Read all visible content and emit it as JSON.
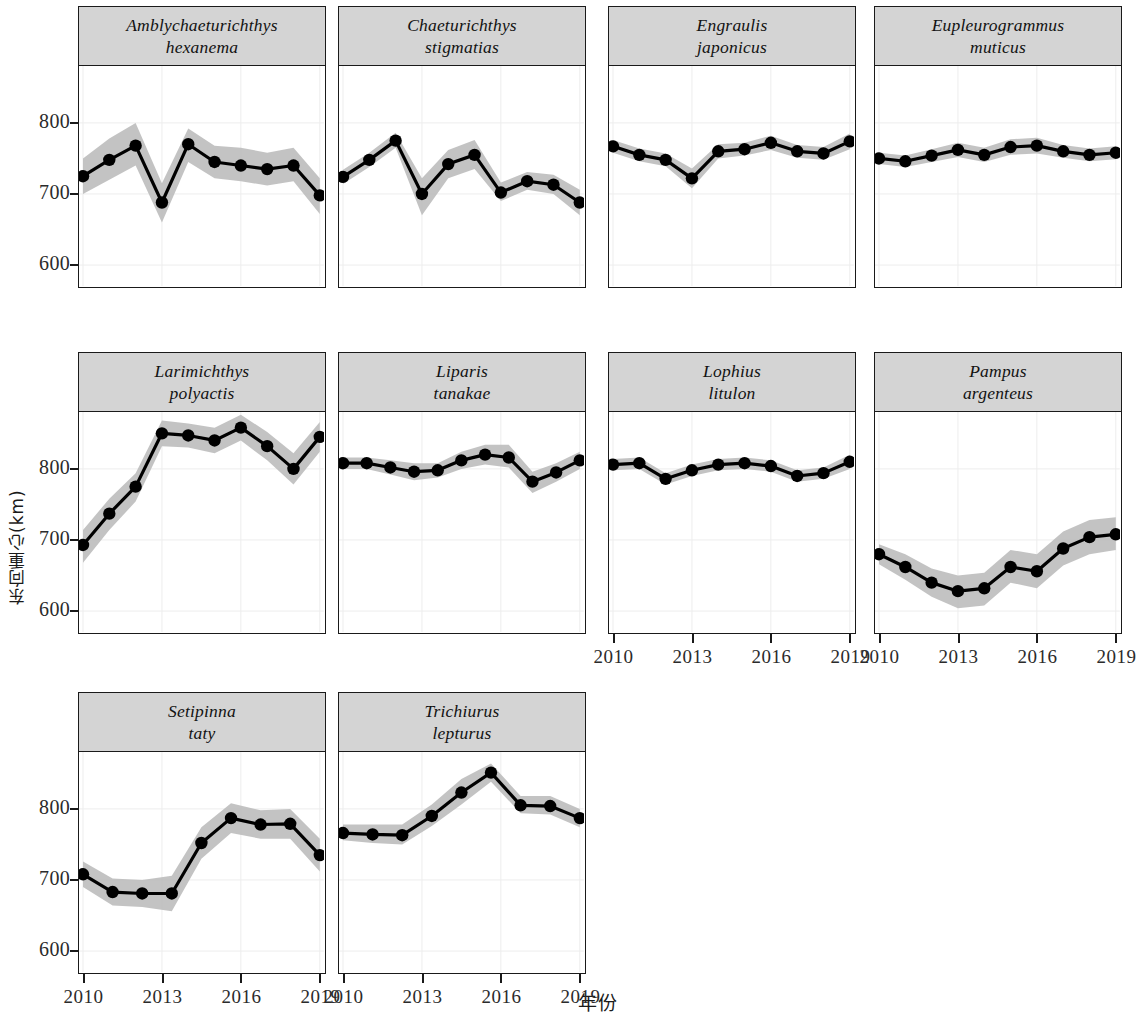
{
  "figure": {
    "y_axis_title": "东向重心(km)",
    "x_axis_title": "年份",
    "y_ticks": [
      "600",
      "700",
      "800"
    ],
    "x_ticks": [
      "2010",
      "2013",
      "2016",
      "2019"
    ]
  },
  "chart_data": {
    "type": "line",
    "title": "",
    "xlabel": "年份",
    "ylabel": "东向重心(km)",
    "xlim": [
      2010,
      2019
    ],
    "ylim": [
      570,
      880
    ],
    "grid": true,
    "legend": "none",
    "x": [
      2010,
      2011,
      2012,
      2013,
      2014,
      2015,
      2016,
      2017,
      2018,
      2019
    ],
    "panels": [
      {
        "name_line1": "Amblychaeturichthys",
        "name_line2": "hexanema",
        "row": 0,
        "col": 0,
        "values": [
          725,
          748,
          768,
          688,
          770,
          745,
          740,
          735,
          740,
          698
        ],
        "lower": [
          700,
          720,
          740,
          660,
          745,
          722,
          718,
          712,
          718,
          672
        ],
        "upper": [
          750,
          778,
          800,
          715,
          792,
          768,
          765,
          758,
          765,
          722
        ]
      },
      {
        "name_line1": "Chaeturichthys",
        "name_line2": "stigmatias",
        "row": 0,
        "col": 1,
        "values": [
          724,
          748,
          775,
          700,
          742,
          755,
          702,
          718,
          713,
          688
        ],
        "lower": [
          714,
          738,
          765,
          670,
          722,
          735,
          690,
          706,
          700,
          670
        ],
        "upper": [
          734,
          758,
          786,
          722,
          762,
          776,
          716,
          731,
          727,
          706
        ]
      },
      {
        "name_line1": "Engraulis",
        "name_line2": "japonicus",
        "row": 0,
        "col": 2,
        "values": [
          767,
          755,
          748,
          722,
          760,
          763,
          772,
          760,
          757,
          774
        ],
        "lower": [
          758,
          746,
          739,
          708,
          750,
          754,
          762,
          751,
          748,
          763
        ],
        "upper": [
          776,
          764,
          757,
          736,
          770,
          772,
          782,
          769,
          766,
          785
        ]
      },
      {
        "name_line1": "Eupleurogrammus",
        "name_line2": "muticus",
        "row": 0,
        "col": 3,
        "values": [
          750,
          746,
          754,
          762,
          755,
          766,
          768,
          760,
          755,
          758
        ],
        "lower": [
          742,
          738,
          745,
          752,
          745,
          755,
          757,
          751,
          746,
          749
        ],
        "upper": [
          758,
          754,
          763,
          772,
          765,
          777,
          779,
          769,
          764,
          767
        ]
      },
      {
        "name_line1": "Larimichthys",
        "name_line2": "polyactis",
        "row": 1,
        "col": 0,
        "values": [
          693,
          737,
          775,
          850,
          847,
          840,
          858,
          832,
          800,
          845
        ],
        "lower": [
          668,
          714,
          754,
          832,
          830,
          822,
          840,
          812,
          778,
          824
        ],
        "upper": [
          714,
          758,
          794,
          868,
          864,
          858,
          876,
          852,
          822,
          866
        ]
      },
      {
        "name_line1": "Liparis",
        "name_line2": "tanakae",
        "row": 1,
        "col": 1,
        "values": [
          808,
          808,
          802,
          796,
          798,
          812,
          820,
          816,
          782,
          795,
          812
        ],
        "lower": [
          800,
          800,
          792,
          784,
          788,
          800,
          806,
          802,
          766,
          782,
          800
        ],
        "upper": [
          816,
          816,
          812,
          808,
          808,
          824,
          834,
          834,
          796,
          808,
          824
        ]
      },
      {
        "name_line1": "Lophius",
        "name_line2": "litulon",
        "row": 1,
        "col": 2,
        "values": [
          806,
          808,
          786,
          798,
          806,
          808,
          804,
          790,
          794,
          810
        ],
        "lower": [
          798,
          800,
          778,
          790,
          798,
          800,
          796,
          782,
          786,
          800
        ],
        "upper": [
          814,
          816,
          794,
          806,
          814,
          816,
          812,
          798,
          802,
          820
        ]
      },
      {
        "name_line1": "Pampus",
        "name_line2": "argenteus",
        "row": 1,
        "col": 3,
        "values": [
          680,
          662,
          640,
          628,
          632,
          662,
          656,
          688,
          704,
          708
        ],
        "lower": [
          666,
          644,
          620,
          604,
          608,
          640,
          632,
          664,
          680,
          686
        ],
        "upper": [
          694,
          680,
          660,
          650,
          654,
          686,
          680,
          712,
          728,
          732
        ]
      },
      {
        "name_line1": "Setipinna",
        "name_line2": "taty",
        "row": 2,
        "col": 0,
        "values": [
          708,
          683,
          681,
          681,
          752,
          787,
          778,
          779,
          735
        ],
        "lower": [
          690,
          664,
          662,
          656,
          730,
          766,
          758,
          758,
          712
        ],
        "upper": [
          726,
          702,
          700,
          706,
          774,
          808,
          798,
          800,
          758
        ]
      },
      {
        "name_line1": "Trichiurus",
        "name_line2": "lepturus",
        "row": 2,
        "col": 1,
        "values": [
          766,
          764,
          763,
          790,
          823,
          851,
          805,
          804,
          787
        ],
        "lower": [
          756,
          752,
          750,
          776,
          806,
          838,
          794,
          792,
          774
        ],
        "upper": [
          778,
          778,
          778,
          806,
          842,
          864,
          818,
          818,
          800
        ]
      }
    ]
  }
}
